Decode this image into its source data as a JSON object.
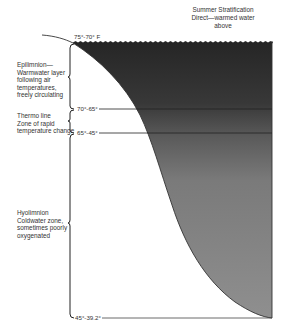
{
  "title": {
    "line1": "Summer Stratification",
    "line2": "Direct—warmed water",
    "line3": "above"
  },
  "zones": [
    {
      "name": "Epilimnion",
      "lines": [
        "Epilimnion—",
        "Warmwater layer",
        "following air",
        "temperatures,",
        "freely circulating"
      ]
    },
    {
      "name": "Thermo line",
      "lines": [
        "Thermo line",
        "Zone of rapid",
        "temperature change"
      ]
    },
    {
      "name": "Hypolimnion",
      "lines": [
        "Hyolimnion",
        "Coldwater zone,",
        "sometimes poorly",
        "oxygenated"
      ]
    }
  ],
  "temperatures": {
    "surface": "75°-70° F",
    "thermocline_top": "70°-65°",
    "thermocline_bottom": "65°-45°",
    "bottom": "45°-39.2°"
  },
  "colors": {
    "water_dark": "#2b2b2b",
    "water_mid": "#6a6a6a",
    "water_light": "#8e8e8e",
    "line": "#333333"
  }
}
